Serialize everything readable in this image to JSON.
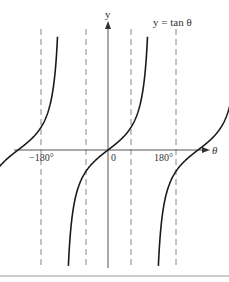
{
  "chart_data": {
    "type": "line",
    "title": "y = tan θ",
    "xlabel": "θ",
    "ylabel": "y",
    "x_ticks": [
      "−180°",
      "0",
      "180°"
    ],
    "asymptotes_deg": [
      -270,
      -90,
      90,
      270
    ],
    "xlim_deg": [
      -330,
      330
    ],
    "grid": false,
    "legend": null,
    "series": [
      {
        "name": "tan θ branch 1",
        "x_range_deg": [
          -270,
          -90
        ],
        "zero_crossing_deg": -180
      },
      {
        "name": "tan θ branch 2",
        "x_range_deg": [
          -90,
          90
        ],
        "zero_crossing_deg": 0
      },
      {
        "name": "tan θ branch 3",
        "x_range_deg": [
          90,
          270
        ],
        "zero_crossing_deg": 180
      }
    ],
    "colors": {
      "curve": "#1a1a1a",
      "axes": "#555555",
      "asymptote": "#888888"
    }
  },
  "labels": {
    "equation": "y = tan θ",
    "y_axis": "y",
    "x_axis": "θ",
    "tick_neg180": "−180°",
    "tick_0": "0",
    "tick_180": "180°"
  }
}
